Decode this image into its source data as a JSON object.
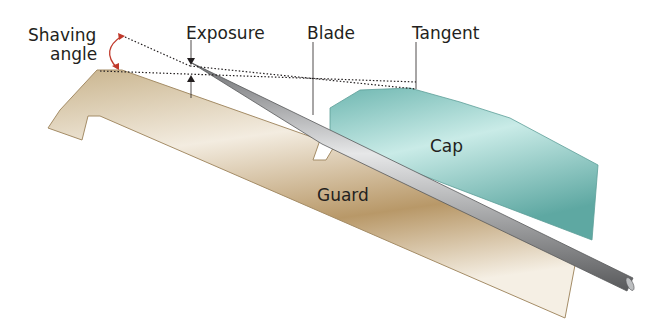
{
  "diagram": {
    "labels": {
      "shaving_angle_line1": "Shaving",
      "shaving_angle_line2": "angle",
      "exposure": "Exposure",
      "blade": "Blade",
      "tangent": "Tangent",
      "cap": "Cap",
      "guard": "Guard"
    },
    "colors": {
      "guard": "#d9c9a8",
      "guard_dark": "#a88a5c",
      "cap": "#8fcfc9",
      "cap_dark": "#5fa9a3",
      "blade": "#a7a9ac",
      "arc_arrow": "#c0392b",
      "text": "#231f20"
    }
  }
}
